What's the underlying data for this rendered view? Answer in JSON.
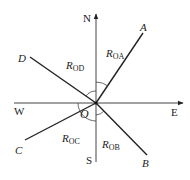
{
  "diagram": {
    "title": "",
    "origin": {
      "label": "O",
      "x": 96,
      "y": 103
    },
    "axes": {
      "north": {
        "label": "N"
      },
      "south": {
        "label": "S"
      },
      "east": {
        "label": "E"
      },
      "west": {
        "label": "W"
      }
    },
    "rays": [
      {
        "id": "A",
        "label": "A",
        "segment_label": "R",
        "segment_sub": "OA",
        "x": 143,
        "y": 33
      },
      {
        "id": "B",
        "label": "B",
        "segment_label": "R",
        "segment_sub": "OB",
        "x": 147,
        "y": 155
      },
      {
        "id": "C",
        "label": "C",
        "segment_label": "R",
        "segment_sub": "OC",
        "x": 25,
        "y": 140
      },
      {
        "id": "D",
        "label": "D",
        "segment_label": "R",
        "segment_sub": "OD",
        "x": 30,
        "y": 57
      }
    ],
    "colors": {
      "line": "#222222",
      "background": "#ffffff"
    }
  }
}
